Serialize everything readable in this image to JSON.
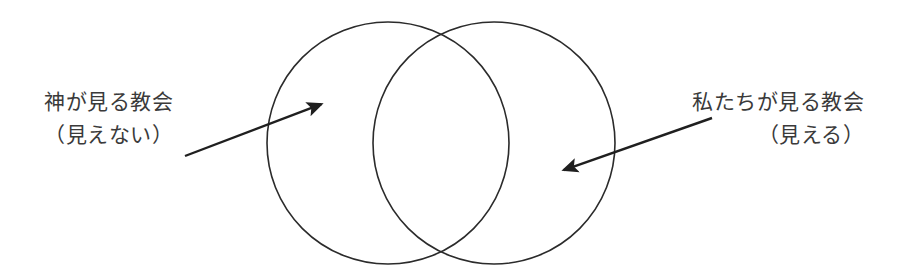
{
  "figure": {
    "type": "venn-diagram",
    "background_color": "#ffffff",
    "stroke_color": "#2b2b2b",
    "text_color": "#3a3a3a"
  },
  "left_label": {
    "line1": "神が見る教会",
    "line2": "（見えない）"
  },
  "right_label": {
    "line1": "私たちが見る教会",
    "line2": "（見える）"
  },
  "shapes": {
    "left_circle": {
      "cx": 388,
      "cy": 143,
      "r": 121
    },
    "right_circle": {
      "cx": 494,
      "cy": 143,
      "r": 121
    }
  },
  "arrows": {
    "left_arrow": {
      "x1": 185,
      "y1": 156,
      "x2": 327,
      "y2": 102
    },
    "right_arrow": {
      "x1": 712,
      "y1": 118,
      "x2": 558,
      "y2": 172
    }
  }
}
